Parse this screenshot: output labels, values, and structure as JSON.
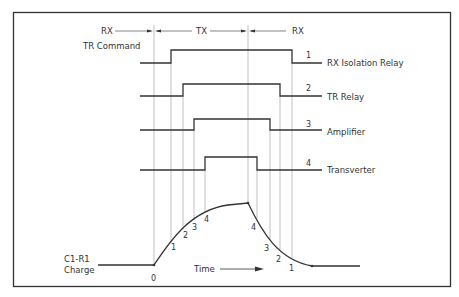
{
  "diagram": {
    "phases": [
      {
        "label": "RX",
        "x_start": 13,
        "x_end": 154
      },
      {
        "label": "TX",
        "x_start": 154,
        "x_end": 248
      },
      {
        "label": "RX",
        "x_start": 248,
        "x_end": 322
      }
    ],
    "tr_command_label": "TR Command",
    "signals": [
      {
        "number": "1",
        "name": "RX Isolation Relay",
        "rise_x": 171,
        "fall_x": 292,
        "low_y": 63,
        "high_y": 50
      },
      {
        "number": "2",
        "name": "TR Relay",
        "rise_x": 183,
        "fall_x": 280,
        "low_y": 96,
        "high_y": 84
      },
      {
        "number": "3",
        "name": "Amplifier",
        "rise_x": 194,
        "fall_x": 270,
        "low_y": 130,
        "high_y": 119
      },
      {
        "number": "4",
        "name": "Transverter",
        "rise_x": 205,
        "fall_x": 257,
        "low_y": 170,
        "high_y": 157
      }
    ],
    "charge_curve": {
      "label_line1": "C1-R1",
      "label_line2": "Charge",
      "origin_label": "0",
      "rise_points": [
        "1",
        "2",
        "3",
        "4"
      ],
      "fall_points": [
        "4",
        "3",
        "2",
        "1"
      ]
    },
    "time_label": "Time",
    "colors": {
      "line": "#333333",
      "guide": "#b0b0b0",
      "border": "#333333",
      "background": "#ffffff"
    }
  }
}
